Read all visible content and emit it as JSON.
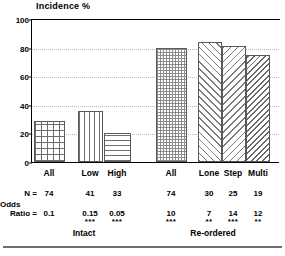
{
  "chart_data": {
    "type": "bar",
    "title": "Incidence %",
    "xlabel": "",
    "ylabel": "Incidence %",
    "ylim": [
      0,
      100
    ],
    "yticks": [
      0,
      20,
      40,
      60,
      80,
      100
    ],
    "grid": true,
    "legend": "none",
    "categories": [
      "All",
      "Low",
      "High",
      "All",
      "Lone",
      "Step",
      "Multi"
    ],
    "values": [
      29,
      36,
      20,
      80,
      84,
      81,
      75
    ],
    "groups": [
      {
        "name": "Intact",
        "categories": [
          "All",
          "Low",
          "High"
        ]
      },
      {
        "name": "Re-ordered",
        "categories": [
          "All",
          "Lone",
          "Step",
          "Multi"
        ]
      }
    ],
    "annotations": {
      "n_label": "N =",
      "odds_label_line1": "Odds",
      "odds_label_line2": "Ratio =",
      "n_values": [
        "74",
        "41",
        "33",
        "74",
        "30",
        "25",
        "19"
      ],
      "odds_values": [
        "0.1",
        "0.15",
        "0.05",
        "10",
        "7",
        "14",
        "12"
      ],
      "significance": [
        "",
        "***",
        "***",
        "***",
        "**",
        "***",
        "**"
      ]
    }
  },
  "axis": {
    "tick_100": "100",
    "tick_80": "80",
    "tick_60": "60",
    "tick_40": "40",
    "tick_20": "20",
    "tick_0": "0"
  },
  "xaxis": {
    "label_0": "All",
    "label_1": "Low",
    "label_2": "High",
    "label_3": "All",
    "label_4": "Lone",
    "label_5": "Step",
    "label_6": "Multi"
  },
  "table": {
    "n_label": "N =",
    "odds_label_line1": "Odds",
    "odds_label_line2": "Ratio =",
    "n_0": "74",
    "n_1": "41",
    "n_2": "33",
    "n_3": "74",
    "n_4": "30",
    "n_5": "25",
    "n_6": "19",
    "or_0": "0.1",
    "or_1": "0.15",
    "or_2": "0.05",
    "or_3": "10",
    "or_4": "7",
    "or_5": "14",
    "or_6": "12",
    "stars_0": "",
    "stars_1": "***",
    "stars_2": "***",
    "stars_3": "***",
    "stars_4": "**",
    "stars_5": "***",
    "stars_6": "**"
  },
  "groups": {
    "left": "Intact",
    "right": "Re-ordered"
  }
}
